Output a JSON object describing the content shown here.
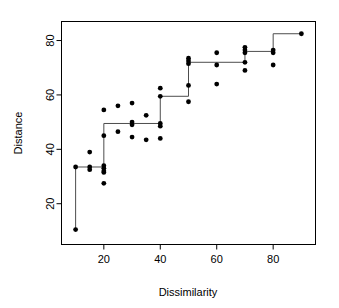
{
  "chart_data": {
    "type": "scatter",
    "title": "",
    "subtitle": "",
    "xlabel": "Dissimilarity",
    "ylabel": "Distance",
    "xlim": [
      5,
      95
    ],
    "ylim": [
      5,
      87
    ],
    "xticks": [
      20,
      40,
      60,
      80
    ],
    "yticks": [
      20,
      40,
      60,
      80
    ],
    "grid": false,
    "legend": null,
    "points": [
      {
        "x": 10,
        "y": 33.5
      },
      {
        "x": 10,
        "y": 10.5
      },
      {
        "x": 15,
        "y": 39
      },
      {
        "x": 15,
        "y": 33.5
      },
      {
        "x": 15,
        "y": 32.5
      },
      {
        "x": 20,
        "y": 54.5
      },
      {
        "x": 20,
        "y": 45
      },
      {
        "x": 20,
        "y": 34
      },
      {
        "x": 20,
        "y": 33
      },
      {
        "x": 20,
        "y": 32
      },
      {
        "x": 20,
        "y": 31.5
      },
      {
        "x": 20,
        "y": 27.5
      },
      {
        "x": 25,
        "y": 56
      },
      {
        "x": 25,
        "y": 46.5
      },
      {
        "x": 30,
        "y": 57
      },
      {
        "x": 30,
        "y": 50
      },
      {
        "x": 30,
        "y": 49
      },
      {
        "x": 30,
        "y": 44.5
      },
      {
        "x": 35,
        "y": 52.5
      },
      {
        "x": 35,
        "y": 43.5
      },
      {
        "x": 40,
        "y": 62.5
      },
      {
        "x": 40,
        "y": 59.5
      },
      {
        "x": 40,
        "y": 49.5
      },
      {
        "x": 40,
        "y": 48.5
      },
      {
        "x": 40,
        "y": 44
      },
      {
        "x": 50,
        "y": 73.5
      },
      {
        "x": 50,
        "y": 72.5
      },
      {
        "x": 50,
        "y": 71.5
      },
      {
        "x": 50,
        "y": 63.5
      },
      {
        "x": 50,
        "y": 57.5
      },
      {
        "x": 60,
        "y": 75.5
      },
      {
        "x": 60,
        "y": 71
      },
      {
        "x": 60,
        "y": 64
      },
      {
        "x": 70,
        "y": 77.5
      },
      {
        "x": 70,
        "y": 76.5
      },
      {
        "x": 70,
        "y": 75.5
      },
      {
        "x": 70,
        "y": 72
      },
      {
        "x": 70,
        "y": 69
      },
      {
        "x": 80,
        "y": 76.5
      },
      {
        "x": 80,
        "y": 75.5
      },
      {
        "x": 80,
        "y": 71
      },
      {
        "x": 90,
        "y": 82.5
      }
    ],
    "step_line": {
      "name": "isotonic-fit",
      "x": [
        10,
        10,
        20,
        20,
        40,
        40,
        50,
        50,
        70,
        70,
        80,
        80,
        90
      ],
      "y": [
        10.5,
        33.5,
        33.5,
        49.5,
        49.5,
        59.5,
        59.5,
        72,
        72,
        76,
        76,
        82.5,
        82.5
      ]
    }
  }
}
